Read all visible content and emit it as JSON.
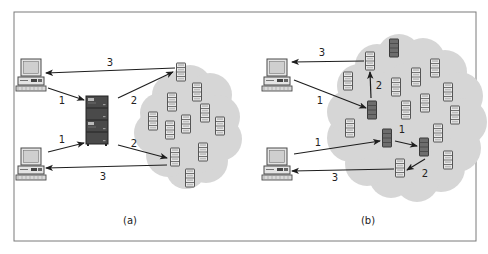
{
  "figure": {
    "frame": {
      "x": 14,
      "y": 12,
      "w": 462,
      "h": 229,
      "stroke": "#7a7a7a"
    },
    "colors": {
      "cloud": "#d6d6d6",
      "server_light_fill": "#e9e9e9",
      "server_light_stroke": "#555555",
      "server_dark_fill": "#6d6d6d",
      "server_dark_stroke": "#3a3a3a",
      "arrow": "#1e1e1e",
      "computer_fill": "#e4e4e4",
      "computer_stroke": "#4a4a4a",
      "rack_fill": "#4a4a4a"
    },
    "panels": [
      {
        "id": "a",
        "caption": "(a)",
        "caption_pos": [
          130,
          224
        ],
        "description": "Centralized directory server mediates lookup before peers exchange data",
        "clients": [
          {
            "id": "a-client-top",
            "x": 30,
            "y": 75
          },
          {
            "id": "a-client-bottom",
            "x": 30,
            "y": 164
          }
        ],
        "central_server": {
          "id": "a-central-server",
          "x": 97,
          "y": 120
        },
        "cloud": {
          "cx": 190,
          "cy": 125
        },
        "peers": [
          {
            "x": 181,
            "y": 72,
            "dark": false
          },
          {
            "x": 197,
            "y": 92,
            "dark": false
          },
          {
            "x": 172,
            "y": 102,
            "dark": false
          },
          {
            "x": 205,
            "y": 113,
            "dark": false
          },
          {
            "x": 153,
            "y": 121,
            "dark": false
          },
          {
            "x": 186,
            "y": 124,
            "dark": false
          },
          {
            "x": 170,
            "y": 130,
            "dark": false
          },
          {
            "x": 220,
            "y": 126,
            "dark": false
          },
          {
            "x": 175,
            "y": 157,
            "dark": false
          },
          {
            "x": 203,
            "y": 152,
            "dark": false
          },
          {
            "x": 190,
            "y": 178,
            "dark": false
          }
        ],
        "arrows": [
          {
            "label": "1",
            "from": [
              48,
              88
            ],
            "to": [
              84,
              100
            ],
            "label_pos": [
              62,
              104
            ]
          },
          {
            "label": "1",
            "from": [
              48,
              152
            ],
            "to": [
              84,
              143
            ],
            "label_pos": [
              62,
              143
            ]
          },
          {
            "label": "2",
            "from": [
              118,
              98
            ],
            "to": [
              173,
              72
            ],
            "label_pos": [
              134,
              104
            ]
          },
          {
            "label": "2",
            "from": [
              118,
              145
            ],
            "to": [
              167,
              158
            ],
            "label_pos": [
              134,
              147
            ]
          },
          {
            "label": "3",
            "from": [
              175,
              68
            ],
            "to": [
              46,
              73
            ],
            "label_pos": [
              110,
              66
            ]
          },
          {
            "label": "3",
            "from": [
              167,
              165
            ],
            "to": [
              46,
              168
            ],
            "label_pos": [
              103,
              180
            ]
          }
        ]
      },
      {
        "id": "b",
        "caption": "(b)",
        "caption_pos": [
          368,
          224
        ],
        "description": "Decentralized peer-to-peer query forwarding among peers in the cloud",
        "clients": [
          {
            "id": "b-client-top",
            "x": 276,
            "y": 75
          },
          {
            "id": "b-client-bottom",
            "x": 276,
            "y": 164
          }
        ],
        "cloud": {
          "cx": 405,
          "cy": 118
        },
        "peers": [
          {
            "x": 394,
            "y": 48,
            "dark": true
          },
          {
            "x": 370,
            "y": 61,
            "dark": false
          },
          {
            "x": 435,
            "y": 68,
            "dark": false
          },
          {
            "x": 348,
            "y": 81,
            "dark": false
          },
          {
            "x": 416,
            "y": 77,
            "dark": false
          },
          {
            "x": 396,
            "y": 87,
            "dark": false
          },
          {
            "x": 448,
            "y": 92,
            "dark": false
          },
          {
            "x": 425,
            "y": 103,
            "dark": false
          },
          {
            "x": 406,
            "y": 110,
            "dark": false
          },
          {
            "x": 372,
            "y": 110,
            "dark": true
          },
          {
            "x": 455,
            "y": 115,
            "dark": false
          },
          {
            "x": 350,
            "y": 128,
            "dark": false
          },
          {
            "x": 438,
            "y": 133,
            "dark": false
          },
          {
            "x": 387,
            "y": 138,
            "dark": true
          },
          {
            "x": 424,
            "y": 147,
            "dark": true
          },
          {
            "x": 448,
            "y": 160,
            "dark": false
          },
          {
            "x": 400,
            "y": 168,
            "dark": false
          }
        ],
        "arrows": [
          {
            "label": "1",
            "from": [
              294,
              80
            ],
            "to": [
              366,
              108
            ],
            "label_pos": [
              320,
              104
            ]
          },
          {
            "label": "2",
            "from": [
              371,
              98
            ],
            "to": [
              370,
              72
            ],
            "label_pos": [
              379,
              89
            ]
          },
          {
            "label": "3",
            "from": [
              364,
              61
            ],
            "to": [
              292,
              62
            ],
            "label_pos": [
              322,
              56
            ]
          },
          {
            "label": "1",
            "from": [
              294,
              154
            ],
            "to": [
              380,
              141
            ],
            "label_pos": [
              318,
              146
            ]
          },
          {
            "label": "1",
            "from": [
              395,
              141
            ],
            "to": [
              417,
              146
            ],
            "label_pos": [
              402,
              133
            ]
          },
          {
            "label": "2",
            "from": [
              425,
              159
            ],
            "to": [
              407,
              170
            ],
            "label_pos": [
              425,
              177
            ]
          },
          {
            "label": "3",
            "from": [
              394,
              169
            ],
            "to": [
              292,
              171
            ],
            "label_pos": [
              335,
              181
            ]
          }
        ]
      }
    ]
  }
}
